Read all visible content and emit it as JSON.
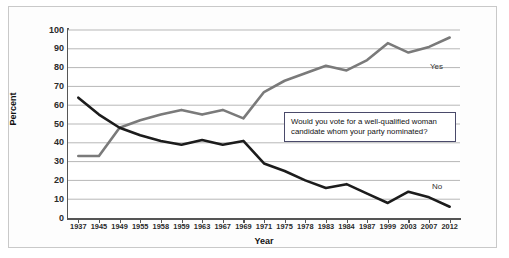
{
  "chart_data": {
    "type": "line",
    "title": "",
    "xlabel": "Year",
    "ylabel": "Percent",
    "ylim": [
      0,
      100
    ],
    "ytick_step": 10,
    "grid": true,
    "legend_position": "inline-labels",
    "categories": [
      "1937",
      "1945",
      "1949",
      "1955",
      "1958",
      "1959",
      "1963",
      "1967",
      "1969",
      "1971",
      "1975",
      "1978",
      "1983",
      "1984",
      "1987",
      "1999",
      "2003",
      "2007",
      "2012"
    ],
    "yticks": [
      "0",
      "10",
      "20",
      "30",
      "40",
      "50",
      "60",
      "70",
      "80",
      "90",
      "100"
    ],
    "series": [
      {
        "name": "Yes",
        "color": "#7a7a7a",
        "values": [
          33,
          33,
          48,
          52,
          55,
          57.5,
          55,
          57.5,
          53,
          67,
          73,
          77,
          81,
          78.5,
          84,
          93,
          88,
          91,
          96
        ]
      },
      {
        "name": "No",
        "color": "#1c1c1c",
        "values": [
          64,
          55,
          48,
          44,
          41,
          39,
          41.5,
          39,
          41,
          29,
          25,
          20,
          16,
          18,
          13,
          8,
          14,
          11,
          6
        ]
      }
    ],
    "annotations": [
      {
        "name": "survey-question",
        "line1": "Would you vote for a well-qualified woman",
        "line2": "candidate whom your party nominated?"
      }
    ]
  },
  "labels": {
    "yes": "Yes",
    "no": "No"
  }
}
